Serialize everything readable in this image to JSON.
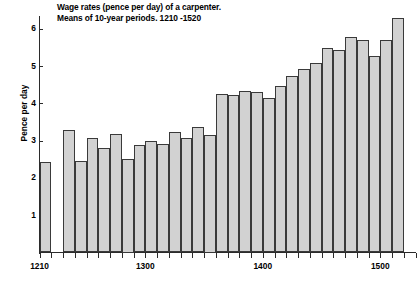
{
  "chart_data": {
    "type": "bar",
    "title": "Wage rates (pence per day) of a carpenter.",
    "subtitle": "Means of 10-year periods.  1210 -1520",
    "title_lines": [
      "Wage rates (pence per day) of a carpenter.",
      "Means of 10-year periods.  1210 -1520"
    ],
    "xlabel": "",
    "ylabel": "Pence per day",
    "ylim": [
      0,
      6.5
    ],
    "xlim": [
      1210,
      1530
    ],
    "grid": false,
    "legend": false,
    "bar_color": "#d2d2d2",
    "bar_edge_color": "#3a3a3a",
    "axis_color": "#2b2b2b",
    "ytick_labels": [
      "1",
      "2",
      "3",
      "4",
      "5",
      "6"
    ],
    "ytick_values": [
      1,
      2,
      3,
      4,
      5,
      6
    ],
    "xtick_labels": [
      "1210",
      "1300",
      "1400",
      "1500"
    ],
    "xtick_values": [
      1210,
      1300,
      1400,
      1500
    ],
    "bar_width_years": 10,
    "categories": [
      1210,
      1230,
      1240,
      1250,
      1260,
      1270,
      1280,
      1290,
      1300,
      1310,
      1320,
      1330,
      1340,
      1350,
      1360,
      1370,
      1380,
      1390,
      1400,
      1410,
      1420,
      1430,
      1440,
      1450,
      1460,
      1470,
      1480,
      1490,
      1500,
      1510
    ],
    "values": [
      2.42,
      3.28,
      2.45,
      3.06,
      2.79,
      3.19,
      2.5,
      2.87,
      2.98,
      2.92,
      3.24,
      3.06,
      3.36,
      3.15,
      4.25,
      4.22,
      4.32,
      4.31,
      4.15,
      4.47,
      4.72,
      4.93,
      5.08,
      5.47,
      5.43,
      5.78,
      5.7,
      5.28,
      5.7,
      6.3
    ],
    "missing_categories": [
      1220
    ],
    "note": "One decade (1220) has no bar - gap in series"
  }
}
